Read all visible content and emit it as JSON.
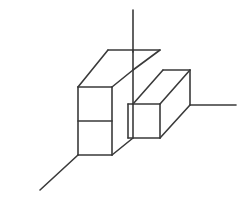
{
  "figure": {
    "background_color": "#ffffff",
    "stroke_color": "#3a3a3a",
    "stroke_width": 1.6,
    "canvas": {
      "width": 244,
      "height": 210
    },
    "projection": "isometric"
  },
  "axes": [
    {
      "name": "vertical-axis",
      "label": "z",
      "x1": 133,
      "y1": 10,
      "x2": 133,
      "y2": 52
    },
    {
      "name": "lower-left-axis",
      "label": "x",
      "x1": 78,
      "y1": 155,
      "x2": 40,
      "y2": 190
    },
    {
      "name": "right-axis",
      "label": "y",
      "x1": 190,
      "y1": 105,
      "x2": 236,
      "y2": 105
    }
  ],
  "shape": {
    "unit": 34,
    "dx": 30,
    "dy": -18,
    "faces": [
      {
        "name": "left-top-face",
        "kind": "top",
        "points": "78,87 108,50 133,50 103,87"
      },
      {
        "name": "left-upper-front-face",
        "kind": "front",
        "points": "78,87 112,87 112,121 78,121"
      },
      {
        "name": "left-lower-front-face",
        "kind": "front",
        "points": "78,121 112,121 112,155 78,155"
      },
      {
        "name": "left-side-face",
        "kind": "side",
        "points": "112,87 133,70 133,138 112,155"
      },
      {
        "name": "tall-column-top-face",
        "kind": "top",
        "points": "103,87 133,50 160,50 133,70"
      },
      {
        "name": "right-top-face",
        "kind": "top",
        "points": "133,104 163,70 190,70 160,104"
      },
      {
        "name": "right-front-face",
        "kind": "front",
        "points": "128,104 160,104 160,138 128,138"
      },
      {
        "name": "right-side-face",
        "kind": "side",
        "points": "160,104 190,70 190,105 160,138"
      }
    ],
    "edges": [
      {
        "name": "edge-top-back-left",
        "x1": 78,
        "y1": 87,
        "x2": 108,
        "y2": 50
      },
      {
        "name": "edge-top-back-ridge",
        "x1": 108,
        "y1": 50,
        "x2": 133,
        "y2": 50
      },
      {
        "name": "edge-top-front-left",
        "x1": 78,
        "y1": 87,
        "x2": 112,
        "y2": 87
      },
      {
        "name": "edge-top-diag-left",
        "x1": 112,
        "y1": 87,
        "x2": 133,
        "y2": 70
      },
      {
        "name": "edge-tall-ridge-top",
        "x1": 133,
        "y1": 50,
        "x2": 160,
        "y2": 50
      },
      {
        "name": "edge-tall-right-diag",
        "x1": 160,
        "y1": 50,
        "x2": 133,
        "y2": 70
      },
      {
        "name": "edge-tall-vertical",
        "x1": 133,
        "y1": 50,
        "x2": 133,
        "y2": 70
      },
      {
        "name": "edge-left-vertical-out",
        "x1": 78,
        "y1": 87,
        "x2": 78,
        "y2": 155
      },
      {
        "name": "edge-left-mid-divider",
        "x1": 78,
        "y1": 121,
        "x2": 112,
        "y2": 121
      },
      {
        "name": "edge-left-vertical-mid",
        "x1": 112,
        "y1": 87,
        "x2": 112,
        "y2": 155
      },
      {
        "name": "edge-left-bottom-front",
        "x1": 78,
        "y1": 155,
        "x2": 112,
        "y2": 155
      },
      {
        "name": "edge-left-bottom-diag",
        "x1": 112,
        "y1": 155,
        "x2": 133,
        "y2": 138
      },
      {
        "name": "edge-left-side-vertical",
        "x1": 133,
        "y1": 70,
        "x2": 133,
        "y2": 138
      },
      {
        "name": "edge-step-top-front",
        "x1": 133,
        "y1": 104,
        "x2": 160,
        "y2": 104
      },
      {
        "name": "edge-step-top-back-diag",
        "x1": 133,
        "y1": 104,
        "x2": 163,
        "y2": 70
      },
      {
        "name": "edge-step-ridge",
        "x1": 163,
        "y1": 70,
        "x2": 190,
        "y2": 70
      },
      {
        "name": "edge-step-right-diag",
        "x1": 190,
        "y1": 70,
        "x2": 160,
        "y2": 104
      },
      {
        "name": "edge-right-vertical",
        "x1": 190,
        "y1": 70,
        "x2": 190,
        "y2": 105
      },
      {
        "name": "edge-right-front-vert",
        "x1": 160,
        "y1": 104,
        "x2": 160,
        "y2": 138
      },
      {
        "name": "edge-right-bottom-diag",
        "x1": 160,
        "y1": 138,
        "x2": 190,
        "y2": 105
      },
      {
        "name": "edge-mid-front-vert",
        "x1": 128,
        "y1": 104,
        "x2": 128,
        "y2": 138
      },
      {
        "name": "edge-mid-front-bottom",
        "x1": 128,
        "y1": 138,
        "x2": 160,
        "y2": 138
      },
      {
        "name": "edge-mid-front-top",
        "x1": 128,
        "y1": 104,
        "x2": 133,
        "y2": 104
      }
    ]
  }
}
